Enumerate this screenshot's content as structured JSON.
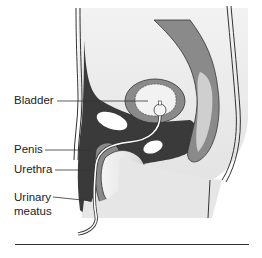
{
  "diagram": {
    "type": "anatomical-cross-section",
    "labels": [
      {
        "id": "bladder",
        "text": "Bladder"
      },
      {
        "id": "penis",
        "text": "Penis"
      },
      {
        "id": "urethra",
        "text": "Urethra"
      },
      {
        "id": "urinary-meatus-line1",
        "text": "Urinary"
      },
      {
        "id": "urinary-meatus-line2",
        "text": "meatus"
      }
    ],
    "colors": {
      "dark_tissue": "#3a3a3a",
      "mid_gray": "#8a8a8a",
      "light_gray": "#d8d8d8",
      "skin": "#ececec",
      "outline": "#2a2a2a"
    }
  }
}
